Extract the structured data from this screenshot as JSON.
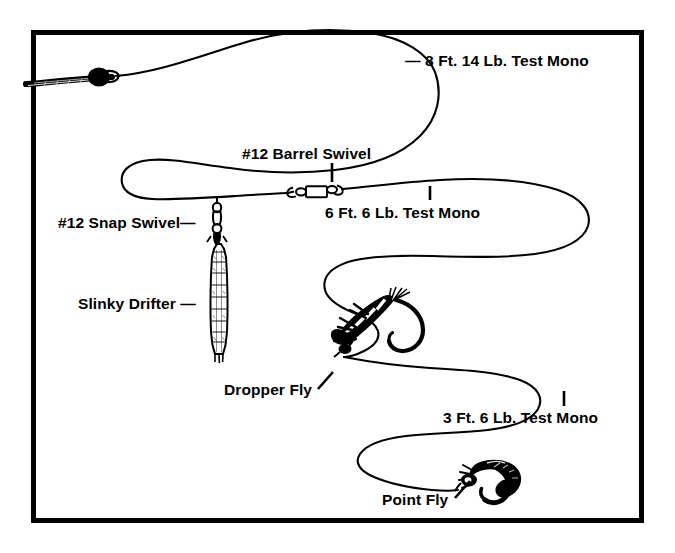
{
  "diagram": {
    "frame_color": "#000000",
    "ink_color": "#000000",
    "background_color": "#ffffff",
    "labels": {
      "top_mono": "— 8 Ft. 14 Lb. Test Mono",
      "barrel_swivel": "#12 Barrel Swivel",
      "mid_mono": "6 Ft. 6 Lb. Test Mono",
      "snap_swivel": "#12 Snap Swivel—",
      "slinky_drifter": "Slinky Drifter —",
      "dropper_fly": "Dropper Fly",
      "bottom_mono": "3 Ft. 6 Lb. Test Mono",
      "point_fly": "Point Fly"
    },
    "components": [
      {
        "name": "fly-line-butt",
        "label": ""
      },
      {
        "name": "nail-knot-connector",
        "label": ""
      },
      {
        "name": "top-mono-section",
        "label": "— 8 Ft. 14 Lb. Test Mono"
      },
      {
        "name": "snap-swivel",
        "label": "#12 Snap Swivel—"
      },
      {
        "name": "slinky-drifter-weight",
        "label": "Slinky Drifter —"
      },
      {
        "name": "barrel-swivel",
        "label": "#12 Barrel Swivel"
      },
      {
        "name": "mid-mono-section",
        "label": "6 Ft. 6 Lb. Test Mono"
      },
      {
        "name": "dropper-fly",
        "label": "Dropper Fly"
      },
      {
        "name": "bottom-mono-section",
        "label": "3 Ft. 6 Lb. Test Mono"
      },
      {
        "name": "point-fly",
        "label": "Point Fly"
      }
    ]
  }
}
